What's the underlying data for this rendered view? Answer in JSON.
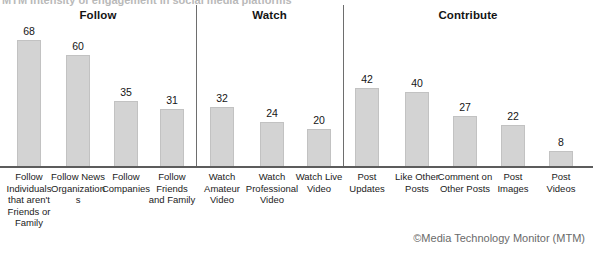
{
  "title_cutoff": "MTM  Intensity of engagement in social media platforms",
  "credit": "©Media Technology Monitor (MTM)",
  "colors": {
    "bar_fill": "#d3d3d3",
    "bar_stroke": "#c2c2c2",
    "axis": "#5c5c5c",
    "separator": "#6e6e6e",
    "text": "#151515",
    "credit_text": "#6a6a6a"
  },
  "panels": [
    {
      "header": "Follow",
      "categories": [
        "Follow Individuals that aren't Friends or Family",
        "Follow News Organizations",
        "Follow Companies",
        "Follow Friends and Family"
      ],
      "values": [
        68,
        60,
        35,
        31
      ]
    },
    {
      "header": "Watch",
      "categories": [
        "Watch Amateur Video",
        "Watch Professional Video",
        "Watch Live Video"
      ],
      "values": [
        32,
        24,
        20
      ]
    },
    {
      "header": "Contribute",
      "categories": [
        "Post Updates",
        "Like Other Posts",
        "Comment on Other Posts",
        "Post Images",
        "Post Videos"
      ],
      "values": [
        42,
        40,
        27,
        22,
        8
      ]
    }
  ],
  "chart_data": {
    "type": "bar",
    "title": "MTM  Intensity of engagement in social media platforms",
    "subtitle": "",
    "xlabel": "",
    "ylabel": "",
    "ylim": [
      0,
      70
    ],
    "grid": false,
    "legend": "none",
    "annotations": [
      "©Media Technology Monitor (MTM)"
    ],
    "groups": [
      {
        "name": "Follow",
        "categories": [
          "Follow Individuals that aren't Friends or Family",
          "Follow News Organizations",
          "Follow Companies",
          "Follow Friends and Family"
        ],
        "values": [
          68,
          60,
          35,
          31
        ]
      },
      {
        "name": "Watch",
        "categories": [
          "Watch Amateur Video",
          "Watch Professional Video",
          "Watch Live Video"
        ],
        "values": [
          32,
          24,
          20
        ]
      },
      {
        "name": "Contribute",
        "categories": [
          "Post Updates",
          "Like Other Posts",
          "Comment on Other Posts",
          "Post Images",
          "Post Videos"
        ],
        "values": [
          42,
          40,
          27,
          22,
          8
        ]
      }
    ],
    "categories": [
      "Follow Individuals that aren't Friends or Family",
      "Follow News Organizations",
      "Follow Companies",
      "Follow Friends and Family",
      "Watch Amateur Video",
      "Watch Professional Video",
      "Watch Live Video",
      "Post Updates",
      "Like Other Posts",
      "Comment on Other Posts",
      "Post Images",
      "Post Videos"
    ],
    "values": [
      68,
      60,
      35,
      31,
      32,
      24,
      20,
      42,
      40,
      27,
      22,
      8
    ]
  },
  "layout": {
    "width": 593,
    "height": 263,
    "baseline_y": 166,
    "max_bar_height": 126,
    "bar_width": 24,
    "separators_x": [
      196,
      343
    ],
    "panel_bounds": [
      {
        "left": 0,
        "right": 196
      },
      {
        "left": 196,
        "right": 343
      },
      {
        "left": 343,
        "right": 593
      }
    ],
    "header_centers": [
      98,
      262,
      468
    ],
    "bar_centers": [
      [
        29,
        78,
        126,
        172
      ],
      [
        222,
        272,
        319
      ],
      [
        367,
        417,
        465,
        513,
        561
      ]
    ],
    "label_widths": [
      [
        56,
        56,
        56,
        50
      ],
      [
        52,
        60,
        56
      ],
      [
        50,
        62,
        56,
        50,
        50
      ]
    ]
  }
}
